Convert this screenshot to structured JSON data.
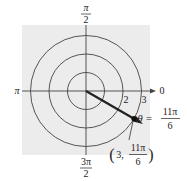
{
  "diagram": {
    "type": "polar-coordinate-plot",
    "background_color": "#ececec",
    "line_color": "#333333",
    "circle_radii": [
      1,
      2,
      3
    ],
    "radius_labels": [
      "2",
      "3"
    ],
    "angle_labels": {
      "top": {
        "num": "π",
        "den": "2"
      },
      "left": "π",
      "right": "0",
      "bottom": {
        "num": "3π",
        "den": "2"
      }
    },
    "ray_label": {
      "theta": "θ =",
      "num": "11π",
      "den": "6"
    },
    "point_label": {
      "prefix": "(3,",
      "num": "11π",
      "den": "6",
      "suffix": ")"
    },
    "point": {
      "r": 3,
      "theta": "11π/6"
    }
  }
}
